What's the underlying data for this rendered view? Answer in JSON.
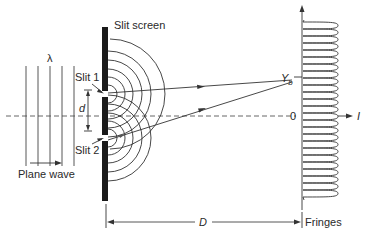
{
  "labels": {
    "slit_screen": "Slit screen",
    "slit1": "Slit 1",
    "slit2": "Slit 2",
    "lambda": "λ",
    "d": "d",
    "plane_wave": "Plane wave",
    "yb_main": "Y",
    "yb_sub": "b",
    "zero": "0",
    "intensity": "I",
    "distance": "D",
    "fringes": "Fringes"
  },
  "colors": {
    "line": "#3a3a3a",
    "screen": "#1a1a1a",
    "dash": "#555555"
  },
  "geometry": {
    "slit_screen_x": 105,
    "slit1_y": 94,
    "slit2_y": 138,
    "axis_y": 116,
    "fringe_screen_x": 302,
    "fringe_count": 20
  }
}
